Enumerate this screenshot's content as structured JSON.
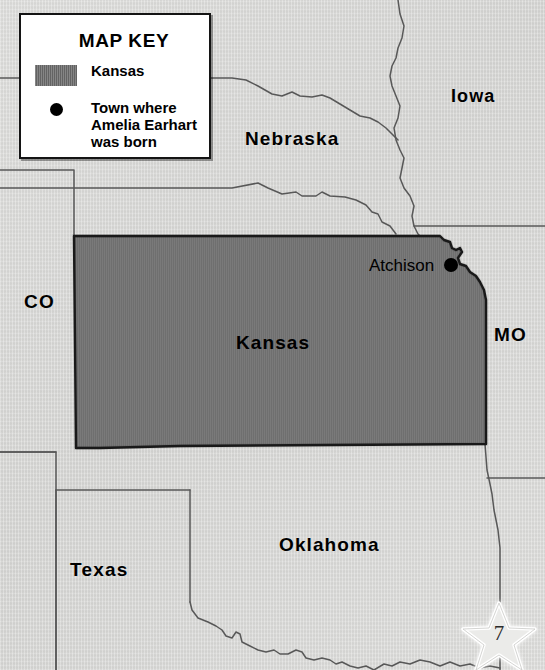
{
  "page": {
    "number": "7",
    "star_icon": "star-icon"
  },
  "legend": {
    "title": "MAP KEY",
    "items": [
      {
        "icon": "filled-rectangle-swatch",
        "label": "Kansas",
        "color": "#6e6e6e"
      },
      {
        "icon": "filled-circle-marker",
        "label": "Town where\nAmelia Earhart\nwas born",
        "color": "#000000"
      }
    ]
  },
  "map": {
    "highlighted_state": "Kansas",
    "highlight_color": "#6e6e6e",
    "background_color": "#d8d8d6",
    "border_color": "#555555",
    "state_labels": [
      {
        "name": "Iowa",
        "text": "Iowa"
      },
      {
        "name": "Nebraska",
        "text": "Nebraska"
      },
      {
        "name": "Colorado",
        "text": "CO"
      },
      {
        "name": "Missouri",
        "text": "MO"
      },
      {
        "name": "Kansas",
        "text": "Kansas"
      },
      {
        "name": "Oklahoma",
        "text": "Oklahoma"
      },
      {
        "name": "Texas",
        "text": "Texas"
      }
    ],
    "city_markers": [
      {
        "name": "Atchison",
        "text": "Atchison",
        "marker": "filled-circle-marker"
      }
    ]
  }
}
